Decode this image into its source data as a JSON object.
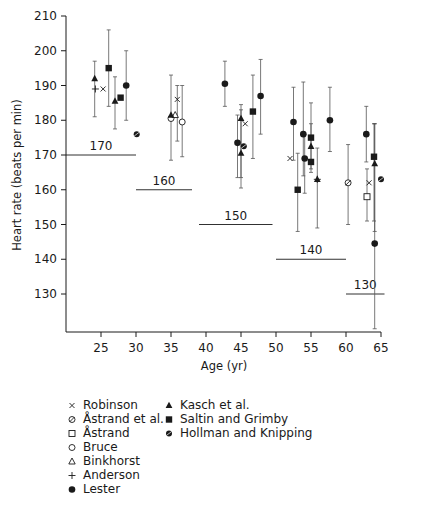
{
  "chart_data": {
    "type": "scatter",
    "title": "",
    "xlabel": "Age (yr)",
    "ylabel": "Heart rate (beats per min)",
    "xlim": [
      20,
      66
    ],
    "ylim": [
      120,
      210
    ],
    "xticks": [
      25,
      30,
      35,
      40,
      45,
      50,
      55,
      60,
      65
    ],
    "yticks": [
      130,
      140,
      150,
      160,
      170,
      180,
      190,
      200,
      210
    ],
    "grid": false,
    "legend_position": "bottom",
    "error_bars": true,
    "reference_lines": [
      {
        "label": "170",
        "y": 170,
        "x_from": 20,
        "x_to": 30
      },
      {
        "label": "160",
        "y": 160,
        "x_from": 30,
        "x_to": 38
      },
      {
        "label": "150",
        "y": 150,
        "x_from": 39,
        "x_to": 49.5
      },
      {
        "label": "140",
        "y": 140,
        "x_from": 50,
        "x_to": 60
      },
      {
        "label": "130",
        "y": 130,
        "x_from": 60,
        "x_to": 65.5
      }
    ],
    "series": [
      {
        "name": "Robinson",
        "marker": "x",
        "points": [
          {
            "x": 25.3,
            "y": 189,
            "err": null
          },
          {
            "x": 35.9,
            "y": 186,
            "err": [
              174,
              190
            ]
          },
          {
            "x": 45.6,
            "y": 179,
            "err": null
          },
          {
            "x": 52.0,
            "y": 169,
            "err": null
          },
          {
            "x": 63.3,
            "y": 162,
            "err": null
          }
        ]
      },
      {
        "name": "Åstrand et al.",
        "marker": "circle-slash",
        "points": [
          {
            "x": 60.3,
            "y": 162,
            "err": [
              150,
              173
            ]
          }
        ]
      },
      {
        "name": "Åstrand",
        "marker": "open-square",
        "points": [
          {
            "x": 63.0,
            "y": 158,
            "err": [
              151,
              166
            ]
          }
        ]
      },
      {
        "name": "Bruce",
        "marker": "open-circle",
        "points": [
          {
            "x": 35.0,
            "y": 180.5,
            "err": null
          },
          {
            "x": 36.6,
            "y": 179.5,
            "err": [
              169.5,
              190
            ]
          }
        ]
      },
      {
        "name": "Binkhorst",
        "marker": "open-triangle",
        "points": [
          {
            "x": 35.6,
            "y": 181.5,
            "err": null
          }
        ]
      },
      {
        "name": "Anderson",
        "marker": "plus",
        "points": [
          {
            "x": 24.2,
            "y": 189,
            "err": null
          },
          {
            "x": 55.9,
            "y": 163,
            "err": null
          }
        ]
      },
      {
        "name": "Lester",
        "marker": "filled-circle",
        "points": [
          {
            "x": 28.6,
            "y": 190,
            "err": [
              180,
              200
            ]
          },
          {
            "x": 42.7,
            "y": 190.5,
            "err": [
              184,
              197
            ]
          },
          {
            "x": 44.5,
            "y": 173.5,
            "err": [
              163.5,
              181.5
            ]
          },
          {
            "x": 47.8,
            "y": 187,
            "err": [
              176,
              197.5
            ]
          },
          {
            "x": 52.5,
            "y": 179.5,
            "err": [
              168.5,
              189.5
            ]
          },
          {
            "x": 53.9,
            "y": 176,
            "err": [
              164,
              191
            ]
          },
          {
            "x": 54.1,
            "y": 169,
            "err": [
              159,
              176
            ]
          },
          {
            "x": 57.7,
            "y": 180,
            "err": [
              171,
              189.5
            ]
          },
          {
            "x": 62.9,
            "y": 176,
            "err": [
              168,
              184
            ]
          },
          {
            "x": 64.1,
            "y": 144.5,
            "err": [
              120,
              179
            ]
          }
        ]
      },
      {
        "name": "Kasch et al.",
        "marker": "filled-triangle",
        "points": [
          {
            "x": 24.1,
            "y": 192,
            "err": [
              181,
              197
            ]
          },
          {
            "x": 27.0,
            "y": 185.5,
            "err": [
              177.5,
              192.5
            ]
          },
          {
            "x": 35.0,
            "y": 181.5,
            "err": [
              168.5,
              193
            ]
          },
          {
            "x": 45.0,
            "y": 180.5,
            "err": [
              163.5,
              184.5
            ]
          },
          {
            "x": 45.0,
            "y": 170.5,
            "err": [
              160.5,
              183
            ]
          },
          {
            "x": 55.0,
            "y": 172.5,
            "err": [
              166,
              185
            ]
          },
          {
            "x": 55.9,
            "y": 163,
            "err": [
              149,
              172
            ]
          },
          {
            "x": 64.1,
            "y": 167.5,
            "err": [
              148,
              179
            ]
          }
        ]
      },
      {
        "name": "Saltin and Grimby",
        "marker": "filled-square",
        "points": [
          {
            "x": 26.1,
            "y": 195,
            "err": [
              184,
              206
            ]
          },
          {
            "x": 27.8,
            "y": 186.5,
            "err": null
          },
          {
            "x": 46.7,
            "y": 182.5,
            "err": [
              169,
              193
            ]
          },
          {
            "x": 53.1,
            "y": 160,
            "err": [
              148,
              170.5
            ]
          },
          {
            "x": 55.0,
            "y": 175,
            "err": [
              165,
              179
            ]
          },
          {
            "x": 55.0,
            "y": 168,
            "err": null
          },
          {
            "x": 64.0,
            "y": 169.5,
            "err": [
              151,
              179
            ]
          }
        ]
      },
      {
        "name": "Hollman and Knipping",
        "marker": "filled-octagon",
        "points": [
          {
            "x": 30.1,
            "y": 176,
            "err": null
          },
          {
            "x": 45.4,
            "y": 172.5,
            "err": null
          },
          {
            "x": 65.0,
            "y": 163,
            "err": null
          }
        ]
      }
    ]
  },
  "legend": {
    "column1": [
      {
        "symbol": "x",
        "label": "Robinson"
      },
      {
        "symbol": "circle-slash",
        "label": "Åstrand et al."
      },
      {
        "symbol": "open-square",
        "label": "Åstrand"
      },
      {
        "symbol": "open-circle",
        "label": "Bruce"
      },
      {
        "symbol": "open-triangle",
        "label": "Binkhorst"
      },
      {
        "symbol": "plus",
        "label": "Anderson"
      },
      {
        "symbol": "filled-circle",
        "label": "Lester"
      }
    ],
    "column2": [
      {
        "symbol": "filled-triangle",
        "label": "Kasch et al."
      },
      {
        "symbol": "filled-square",
        "label": "Saltin and Grimby"
      },
      {
        "symbol": "filled-octagon",
        "label": "Hollman and Knipping"
      }
    ]
  },
  "colors": {
    "ink": "#1a1a1a",
    "errorbar": "#555555",
    "background": "#ffffff"
  }
}
